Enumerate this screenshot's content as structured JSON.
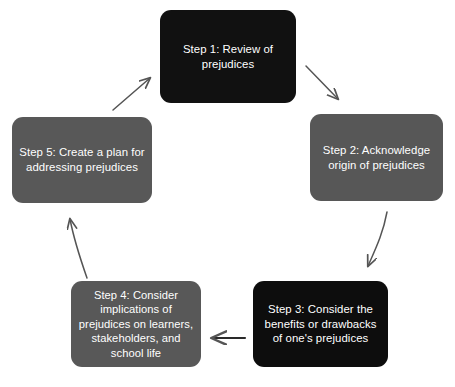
{
  "diagram": {
    "type": "cycle",
    "direction": "clockwise",
    "colors": {
      "dark_box": "#111111",
      "gray_box": "#575757",
      "box_text": "#ffffff",
      "arrow": "#555555",
      "background": "#ffffff"
    },
    "steps": [
      {
        "id": "step-1",
        "label": "Step 1: Review of prejudices",
        "fill": "#111111",
        "position": "top-center"
      },
      {
        "id": "step-2",
        "label": "Step 2: Acknowledge origin of prejudices",
        "fill": "#575757",
        "position": "right"
      },
      {
        "id": "step-3",
        "label": "Step 3: Consider the benefits or drawbacks of one's prejudices",
        "fill": "#0d0d0d",
        "position": "bottom-right"
      },
      {
        "id": "step-4",
        "label": "Step 4: Consider implications  of prejudices on learners, stakeholders, and school life",
        "fill": "#585858",
        "position": "bottom-left"
      },
      {
        "id": "step-5",
        "label": "Step 5: Create a plan for addressing prejudices",
        "fill": "#585858",
        "position": "left"
      }
    ],
    "arrows": [
      {
        "id": "arrow-1-to-2",
        "from": "step-1",
        "to": "step-2",
        "direction": "down-right"
      },
      {
        "id": "arrow-2-to-3",
        "from": "step-2",
        "to": "step-3",
        "direction": "down-left"
      },
      {
        "id": "arrow-3-to-4",
        "from": "step-3",
        "to": "step-4",
        "direction": "left"
      },
      {
        "id": "arrow-4-to-5",
        "from": "step-4",
        "to": "step-5",
        "direction": "up-left"
      },
      {
        "id": "arrow-5-to-1",
        "from": "step-5",
        "to": "step-1",
        "direction": "up-right"
      }
    ]
  }
}
